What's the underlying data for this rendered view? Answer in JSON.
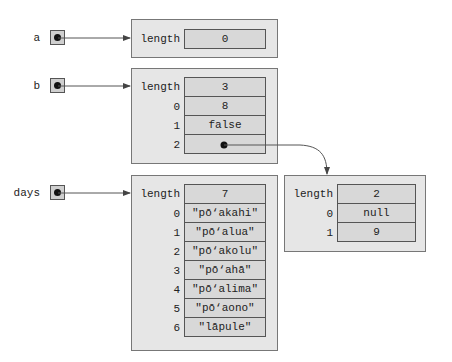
{
  "variables": [
    {
      "name": "a",
      "points_to": "array_a"
    },
    {
      "name": "b",
      "points_to": "array_b"
    },
    {
      "name": "days",
      "points_to": "array_days"
    }
  ],
  "objects": {
    "array_a": {
      "rows": [
        {
          "key": "length",
          "value": "0"
        }
      ]
    },
    "array_b": {
      "rows": [
        {
          "key": "length",
          "value": "3"
        },
        {
          "key": "0",
          "value": "8"
        },
        {
          "key": "1",
          "value": "false"
        },
        {
          "key": "2",
          "value": "",
          "is_reference": true,
          "points_to": "array_inner"
        }
      ]
    },
    "array_days": {
      "rows": [
        {
          "key": "length",
          "value": "7"
        },
        {
          "key": "0",
          "value": "\"pō‘akahi\""
        },
        {
          "key": "1",
          "value": "\"pō‘alua\""
        },
        {
          "key": "2",
          "value": "\"pō‘akolu\""
        },
        {
          "key": "3",
          "value": "\"pō‘ahā\""
        },
        {
          "key": "4",
          "value": "\"pō‘alima\""
        },
        {
          "key": "5",
          "value": "\"pō‘aono\""
        },
        {
          "key": "6",
          "value": "\"lāpule\""
        }
      ]
    },
    "array_inner": {
      "rows": [
        {
          "key": "length",
          "value": "2"
        },
        {
          "key": "0",
          "value": "null"
        },
        {
          "key": "1",
          "value": "9"
        }
      ]
    }
  },
  "colors": {
    "object_fill": "#e6e6e6",
    "cell_fill": "#d8d8d8",
    "border": "#555555",
    "arrow": "#444444"
  }
}
